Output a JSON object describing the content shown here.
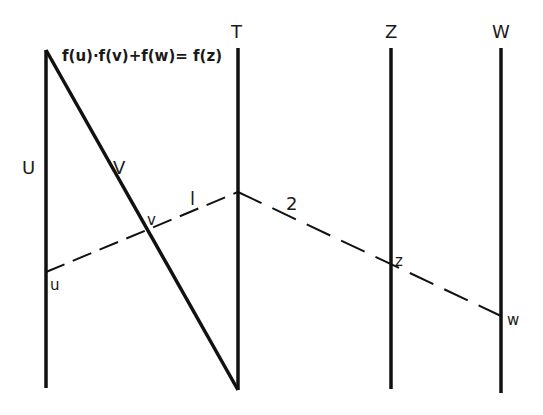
{
  "diagram": {
    "title_formula": "f(u)·f(v)+f(w)= f(z)",
    "scales": [
      {
        "id": "U",
        "label": "U"
      },
      {
        "id": "V",
        "label": "V"
      },
      {
        "id": "T",
        "label": "T"
      },
      {
        "id": "Z",
        "label": "Z"
      },
      {
        "id": "W",
        "label": "W"
      }
    ],
    "points": {
      "u": "u",
      "v": "v",
      "z": "z",
      "w": "w"
    },
    "isopleths": [
      {
        "id": "1",
        "label": "l"
      },
      {
        "id": "2",
        "label": "2"
      }
    ],
    "colors": {
      "line": "#111111",
      "background": "#ffffff"
    }
  }
}
